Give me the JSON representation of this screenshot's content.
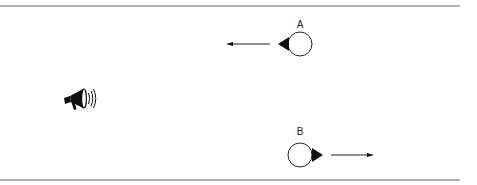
{
  "diagram": {
    "source": {
      "icon": "megaphone-icon"
    },
    "listeners": [
      {
        "label": "A",
        "direction": "left"
      },
      {
        "label": "B",
        "direction": "right"
      }
    ],
    "colors": {
      "line": "#555555",
      "ink": "#111111",
      "background": "#ffffff"
    }
  }
}
